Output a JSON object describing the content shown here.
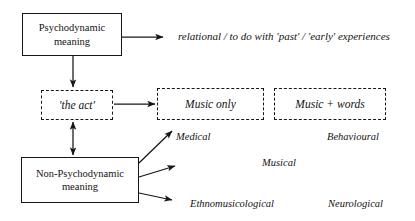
{
  "diagram": {
    "nodes": {
      "psychodynamic": {
        "label": "Psychodynamic\nmeaning",
        "line1": "Psychodynamic",
        "line2": "meaning",
        "style": "solid"
      },
      "the_act": {
        "label": "'the act'",
        "style": "dashed"
      },
      "music_only": {
        "label": "Music only",
        "style": "dashed"
      },
      "music_words": {
        "label": "Music + words",
        "style": "dashed"
      },
      "non_psychodynamic": {
        "label": "Non-Psychodynamic\nmeaning",
        "line1": "Non-Psychodynamic",
        "line2": "meaning",
        "style": "solid"
      }
    },
    "annotations": {
      "relational": "relational / to do with 'past' / 'early' experiences",
      "medical": "Medical",
      "behavioural": "Behavioural",
      "musical": "Musical",
      "ethnomusicological": "Ethnomusicological",
      "neurological": "Neurological"
    },
    "colors": {
      "ink": "#15161a",
      "background": "#ffffff"
    }
  }
}
